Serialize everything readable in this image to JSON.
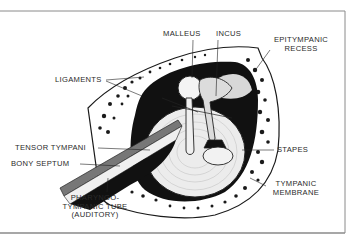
{
  "diagram": {
    "type": "anatomical cross-section",
    "labels": {
      "malleus": "MALLEUS",
      "incus": "INCUS",
      "epitympanic_1": "EPITYMPANIC",
      "epitympanic_2": "RECESS",
      "ligaments": "LIGAMENTS",
      "tensor": "TENSOR TYMPANI",
      "septum": "BONY SEPTUM",
      "stapes": "STAPES",
      "tympanic_1": "TYMPANIC",
      "tympanic_2": "MEMBRANE",
      "pharyngo_1": "PHARYNGO-",
      "pharyngo_2": "TYMPANIC TUBE",
      "pharyngo_3": "(AUDITORY)"
    },
    "colors": {
      "ink": "#1a1a1a",
      "paper": "#ffffff",
      "frame": "#8a8a8a",
      "membrane": "#e8e8e8"
    }
  }
}
